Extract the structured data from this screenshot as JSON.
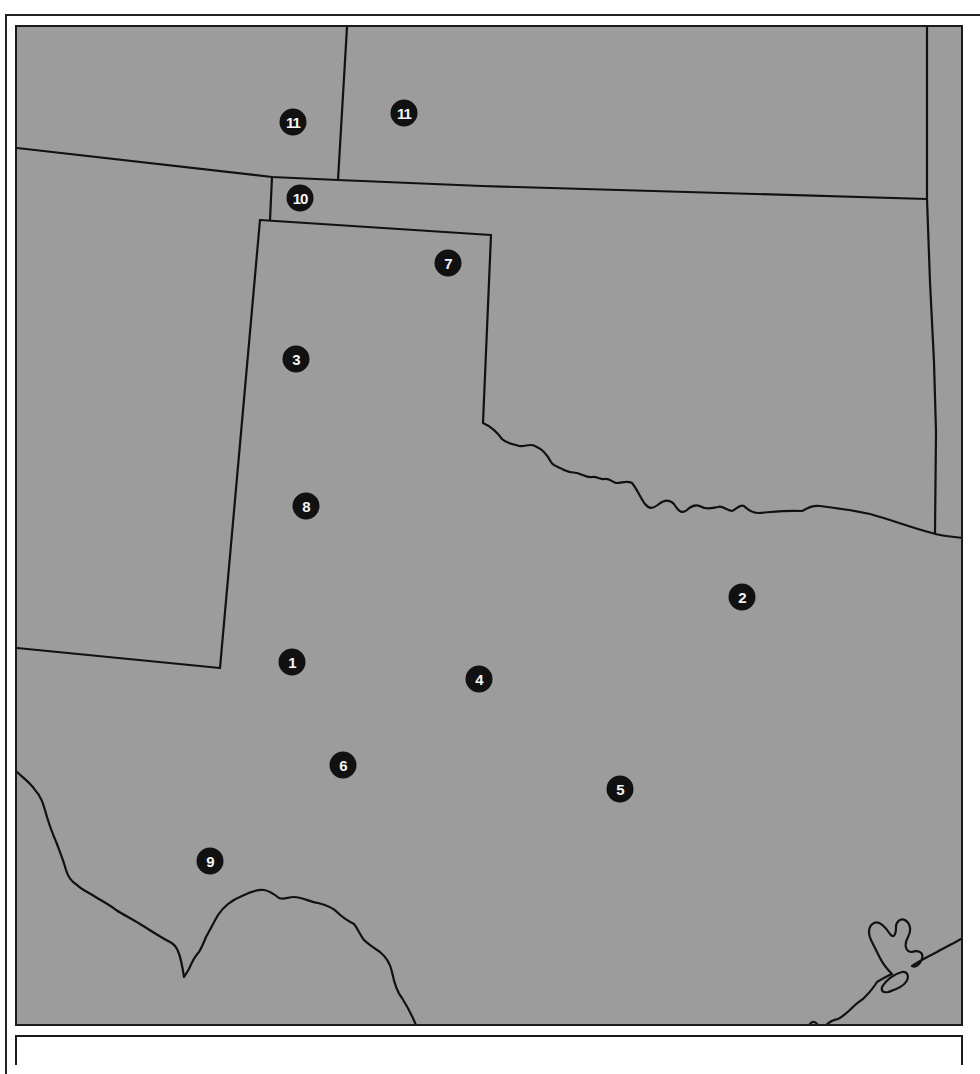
{
  "map": {
    "background_color": "#9c9c9c",
    "border_color": "#1a1a1a",
    "marker_color": "#111111",
    "marker_text_color": "#f4f4f4",
    "markers": [
      {
        "label": "1",
        "x": 292,
        "y": 662
      },
      {
        "label": "2",
        "x": 742,
        "y": 597
      },
      {
        "label": "3",
        "x": 296,
        "y": 359
      },
      {
        "label": "4",
        "x": 479,
        "y": 679
      },
      {
        "label": "5",
        "x": 620,
        "y": 789
      },
      {
        "label": "6",
        "x": 343,
        "y": 765
      },
      {
        "label": "7",
        "x": 448,
        "y": 263
      },
      {
        "label": "8",
        "x": 306,
        "y": 506
      },
      {
        "label": "9",
        "x": 210,
        "y": 861
      },
      {
        "label": "10",
        "x": 300,
        "y": 198
      },
      {
        "label": "11",
        "x": 293,
        "y": 122
      },
      {
        "label": "11",
        "x": 404,
        "y": 113
      }
    ]
  }
}
